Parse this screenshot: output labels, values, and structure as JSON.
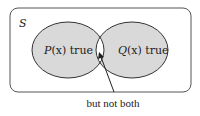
{
  "diagram": {
    "universe_label": "S",
    "left_set": {
      "label_prefix": "P",
      "label_var": "(x)",
      "label_suffix": " true"
    },
    "right_set": {
      "label_prefix": "Q",
      "label_var": "(x)",
      "label_suffix": " true"
    },
    "annotation": "but not both",
    "colors": {
      "fill": "#d9d9d9",
      "intersection": "#ffffff",
      "stroke": "#333333",
      "frame": "#555555"
    }
  }
}
